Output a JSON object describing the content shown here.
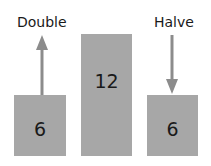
{
  "labels": {
    "left": "Double",
    "right": "Halve"
  },
  "boxes": [
    {
      "value": "6"
    },
    {
      "value": "12"
    },
    {
      "value": "6"
    }
  ],
  "colors": {
    "box": "#a7a7a7",
    "arrow": "#8c8c8c",
    "text": "#1a1a1a"
  }
}
